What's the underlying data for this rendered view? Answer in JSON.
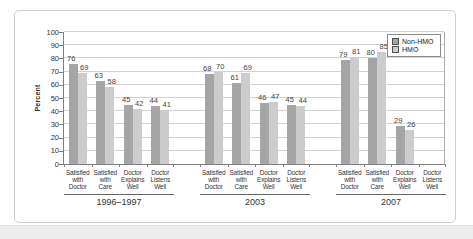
{
  "chart_data": {
    "type": "bar",
    "title": "",
    "xlabel": "",
    "ylabel": "Percent",
    "ylim": [
      0,
      100
    ],
    "ytick_step": 10,
    "grid": true,
    "legend": {
      "position": "top-right",
      "entries": [
        {
          "label": "Non-HMO",
          "color": "#a5a5a5"
        },
        {
          "label": "HMO",
          "color": "#cccccc"
        }
      ]
    },
    "categories": [
      "Satisfied with Doctor",
      "Satisfied with Care",
      "Doctor Explains Well",
      "Doctor Listens Well"
    ],
    "groups": [
      {
        "label": "1996–1997",
        "series": [
          {
            "name": "Non-HMO",
            "values": [
              76,
              63,
              45,
              44
            ]
          },
          {
            "name": "HMO",
            "values": [
              69,
              58,
              42,
              41
            ]
          }
        ]
      },
      {
        "label": "2003",
        "series": [
          {
            "name": "Non-HMO",
            "values": [
              68,
              61,
              46,
              45
            ]
          },
          {
            "name": "HMO",
            "values": [
              70,
              69,
              47,
              44
            ]
          }
        ]
      },
      {
        "label": "2007",
        "series": [
          {
            "name": "Non-HMO",
            "values": [
              79,
              80,
              29,
              null
            ]
          },
          {
            "name": "HMO",
            "values": [
              81,
              85,
              26,
              null
            ]
          }
        ]
      }
    ]
  },
  "colors": {
    "non_hmo": "#a5a5a5",
    "hmo": "#cccccc",
    "grid": "#d2d2d2",
    "axis": "#7f7f7f",
    "text": "#333333",
    "figure_border": "#cfcfcf"
  }
}
